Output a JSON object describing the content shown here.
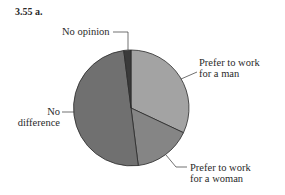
{
  "figure": {
    "title": "3.55 a."
  },
  "chart_data": {
    "type": "pie",
    "title": "3.55 a.",
    "categories": [
      "Prefer to work for a man",
      "Prefer to work for a woman",
      "No difference",
      "No opinion"
    ],
    "values": [
      32,
      16,
      50,
      2
    ],
    "unit": "percent (estimated from slice angles)",
    "start_angle_deg": 0,
    "direction": "clockwise",
    "colors": [
      "#a3a3a3",
      "#858585",
      "#707070",
      "#3a3a3a"
    ],
    "legend": "none (leader-line labels)",
    "labels": [
      {
        "line1": "Prefer to work",
        "line2": "for a man"
      },
      {
        "line1": "Prefer to work",
        "line2": "for a woman"
      },
      {
        "line1": "No",
        "line2": "difference"
      },
      {
        "line1": "No opinion",
        "line2": ""
      }
    ]
  }
}
